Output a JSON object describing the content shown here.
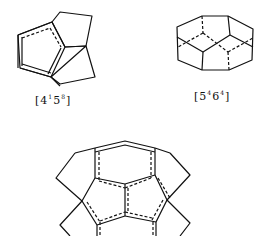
{
  "figure": {
    "cages": [
      {
        "id": "cage-4-1-5-8",
        "label_base": "[4",
        "sup1": "1",
        "mid": "5",
        "sup2": "8",
        "close": "]",
        "label": "[4¹5⁸]"
      },
      {
        "id": "cage-5-4-6-4",
        "label_base": "[5",
        "sup1": "4",
        "mid": "6",
        "sup2": "4",
        "close": "]",
        "label": "[5⁴6⁴]"
      },
      {
        "id": "cage-composite",
        "label": ""
      }
    ],
    "stroke_color": "#111111",
    "background": "#ffffff"
  }
}
